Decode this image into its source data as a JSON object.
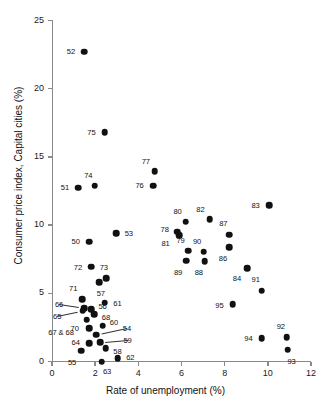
{
  "chart_data": {
    "type": "scatter",
    "title": "",
    "xlabel": "Rate of unemployment (%)",
    "ylabel": "Consumer price index, Capital cities (%)",
    "xlim": [
      0,
      12
    ],
    "ylim": [
      0,
      25
    ],
    "xticks": [
      0,
      2,
      4,
      6,
      8,
      10,
      12
    ],
    "yticks": [
      0,
      5,
      10,
      15,
      20,
      25
    ],
    "grid": false,
    "legend": null,
    "point_label_field": "label",
    "points": [
      {
        "label": "52",
        "x": 1.5,
        "y": 22.7,
        "lx": -0.62,
        "ly": 0.1
      },
      {
        "label": "75",
        "x": 2.45,
        "y": 16.8,
        "lx": -0.62,
        "ly": 0.05
      },
      {
        "label": "77",
        "x": 4.75,
        "y": 13.95,
        "lx": -0.4,
        "ly": 0.78
      },
      {
        "label": "76",
        "x": 4.68,
        "y": 12.9,
        "lx": -0.62,
        "ly": 0.05
      },
      {
        "label": "74",
        "x": 1.98,
        "y": 12.9,
        "lx": -0.3,
        "ly": 0.8
      },
      {
        "label": "51",
        "x": 1.22,
        "y": 12.75,
        "lx": -0.62,
        "ly": 0.02
      },
      {
        "label": "83",
        "x": 10.05,
        "y": 11.45,
        "lx": -0.62,
        "ly": 0.06
      },
      {
        "label": "82",
        "x": 7.3,
        "y": 10.45,
        "lx": -0.42,
        "ly": 0.76
      },
      {
        "label": "80",
        "x": 6.2,
        "y": 10.25,
        "lx": -0.38,
        "ly": 0.8
      },
      {
        "label": "78",
        "x": 5.8,
        "y": 9.52,
        "lx": -0.58,
        "ly": 0.18
      },
      {
        "label": "81",
        "x": 5.88,
        "y": 9.28,
        "lx": -0.62,
        "ly": -0.58
      },
      {
        "label": "53",
        "x": 2.98,
        "y": 9.42,
        "lx": 0.58,
        "ly": -0.02
      },
      {
        "label": "87",
        "x": 8.22,
        "y": 9.3,
        "lx": -0.28,
        "ly": 0.82
      },
      {
        "label": "50",
        "x": 1.72,
        "y": 8.78,
        "lx": -0.62,
        "ly": 0.02
      },
      {
        "label": "86",
        "x": 8.22,
        "y": 8.38,
        "lx": -0.3,
        "ly": -0.78
      },
      {
        "label": "79",
        "x": 6.3,
        "y": 8.12,
        "lx": -0.34,
        "ly": 0.8
      },
      {
        "label": "90",
        "x": 7.02,
        "y": 8.05,
        "lx": -0.3,
        "ly": 0.8
      },
      {
        "label": "89",
        "x": 6.22,
        "y": 7.38,
        "lx": -0.38,
        "ly": -0.8
      },
      {
        "label": "88",
        "x": 7.08,
        "y": 7.35,
        "lx": -0.28,
        "ly": -0.82
      },
      {
        "label": "72",
        "x": 1.82,
        "y": 6.95,
        "lx": -0.62,
        "ly": -0.05
      },
      {
        "label": "84",
        "x": 9.05,
        "y": 6.82,
        "lx": -0.48,
        "ly": -0.72
      },
      {
        "label": "73",
        "x": 2.52,
        "y": 6.12,
        "lx": -0.12,
        "ly": 0.8
      },
      {
        "label": "57",
        "x": 2.18,
        "y": 5.8,
        "lx": 0.08,
        "ly": -0.8
      },
      {
        "label": "91",
        "x": 9.72,
        "y": 5.2,
        "lx": -0.28,
        "ly": 0.82
      },
      {
        "label": "71",
        "x": 1.4,
        "y": 4.58,
        "lx": -0.42,
        "ly": 0.78
      },
      {
        "label": "61",
        "x": 2.45,
        "y": 4.3,
        "lx": 0.58,
        "ly": 0.02
      },
      {
        "label": "95",
        "x": 8.38,
        "y": 4.22,
        "lx": -0.62,
        "ly": -0.08
      },
      {
        "label": "66",
        "x": 1.48,
        "y": 3.92,
        "lx": -1.15,
        "ly": 0.28,
        "leader": true
      },
      {
        "label": "56",
        "x": 1.82,
        "y": 3.82,
        "lx": 0.52,
        "ly": 0.22
      },
      {
        "label": "65",
        "x": 1.42,
        "y": 3.72,
        "lx": -1.18,
        "ly": -0.38,
        "leader": true
      },
      {
        "label": "68",
        "x": 1.95,
        "y": 3.48,
        "lx": 0.55,
        "ly": -0.22
      },
      {
        "label": "70",
        "x": 1.6,
        "y": 3.05,
        "lx": -0.55,
        "ly": -0.62
      },
      {
        "label": "60",
        "x": 2.35,
        "y": 2.62,
        "lx": 0.52,
        "ly": 0.3
      },
      {
        "label": "67 & 68",
        "x": 1.72,
        "y": 2.42,
        "lx": -1.3,
        "ly": -0.25
      },
      {
        "label": "54",
        "x": 2.05,
        "y": 1.95,
        "lx": 1.42,
        "ly": 0.5,
        "leader": true
      },
      {
        "label": "59",
        "x": 2.22,
        "y": 1.42,
        "lx": 1.28,
        "ly": 0.18,
        "leader": true
      },
      {
        "label": "64",
        "x": 1.72,
        "y": 1.32,
        "lx": -0.62,
        "ly": 0.08
      },
      {
        "label": "58",
        "x": 2.48,
        "y": 0.98,
        "lx": 0.55,
        "ly": -0.22
      },
      {
        "label": "55",
        "x": 1.35,
        "y": 0.78,
        "lx": -0.42,
        "ly": -0.78
      },
      {
        "label": "62",
        "x": 3.05,
        "y": 0.22,
        "lx": 0.58,
        "ly": 0.1
      },
      {
        "label": "63",
        "x": 2.3,
        "y": 0.0,
        "lx": 0.25,
        "ly": -0.72
      },
      {
        "label": "94",
        "x": 9.72,
        "y": 1.72,
        "lx": -0.62,
        "ly": 0.02
      },
      {
        "label": "92",
        "x": 10.88,
        "y": 1.78,
        "lx": -0.28,
        "ly": 0.82
      },
      {
        "label": "93",
        "x": 10.92,
        "y": 0.85,
        "lx": 0.18,
        "ly": -0.82
      }
    ]
  }
}
